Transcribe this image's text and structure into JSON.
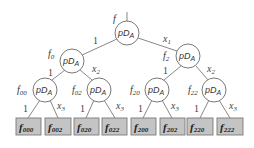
{
  "diagram": {
    "type": "binary decision tree",
    "node_label": "pD",
    "node_label_sub": "A",
    "root": {
      "label": "f",
      "sub": ""
    },
    "level1": [
      {
        "label": "f",
        "sub": "0"
      },
      {
        "label": "f",
        "sub": "2"
      }
    ],
    "level2": [
      {
        "label": "f",
        "sub": "00"
      },
      {
        "label": "f",
        "sub": "02"
      },
      {
        "label": "f",
        "sub": "20"
      },
      {
        "label": "f",
        "sub": "22"
      }
    ],
    "leaves": [
      {
        "label": "f",
        "sub": "000"
      },
      {
        "label": "f",
        "sub": "002"
      },
      {
        "label": "f",
        "sub": "020"
      },
      {
        "label": "f",
        "sub": "022"
      },
      {
        "label": "f",
        "sub": "200"
      },
      {
        "label": "f",
        "sub": "202"
      },
      {
        "label": "f",
        "sub": "220"
      },
      {
        "label": "f",
        "sub": "222"
      }
    ],
    "edge_labels": {
      "left": "1",
      "level1_right": {
        "var": "x",
        "sub": "1"
      },
      "level2_right": {
        "var": "x",
        "sub": "2"
      },
      "level3_right": {
        "var": "x",
        "sub": "3"
      }
    }
  }
}
